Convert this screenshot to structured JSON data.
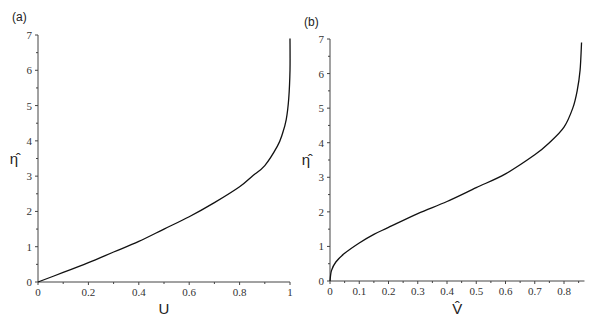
{
  "chart_data": [
    {
      "type": "line",
      "panel_label": "(a)",
      "xlabel": "U",
      "ylabel": "η̂",
      "xlim": [
        0,
        1
      ],
      "ylim": [
        0,
        7
      ],
      "xticks": [
        "0",
        "0.2",
        "0.4",
        "0.6",
        "0.8",
        "1"
      ],
      "yticks": [
        "0",
        "1",
        "2",
        "3",
        "4",
        "5",
        "6",
        "7"
      ],
      "grid": false,
      "series": [
        {
          "name": "U profile",
          "x": [
            0,
            0.1,
            0.2,
            0.3,
            0.4,
            0.5,
            0.6,
            0.7,
            0.8,
            0.85,
            0.9,
            0.95,
            0.97,
            0.985,
            0.995,
            1.0,
            1.0
          ],
          "y": [
            0,
            0.27,
            0.55,
            0.85,
            1.15,
            1.5,
            1.85,
            2.25,
            2.7,
            3.0,
            3.3,
            3.85,
            4.2,
            4.6,
            5.2,
            6.0,
            6.9
          ]
        }
      ]
    },
    {
      "type": "line",
      "panel_label": "(b)",
      "xlabel": "V̂",
      "ylabel": "η̂",
      "xlim": [
        0,
        0.87
      ],
      "ylim": [
        0,
        7
      ],
      "xticks": [
        "0",
        "0.1",
        "0.2",
        "0.3",
        "0.4",
        "0.5",
        "0.6",
        "0.7",
        "0.8"
      ],
      "yticks": [
        "0",
        "1",
        "2",
        "3",
        "4",
        "5",
        "6",
        "7"
      ],
      "grid": false,
      "series": [
        {
          "name": "V profile",
          "x": [
            0,
            0.005,
            0.02,
            0.05,
            0.1,
            0.15,
            0.2,
            0.3,
            0.4,
            0.5,
            0.6,
            0.7,
            0.75,
            0.8,
            0.83,
            0.845,
            0.855,
            0.86
          ],
          "y": [
            0,
            0.3,
            0.55,
            0.8,
            1.1,
            1.35,
            1.55,
            1.95,
            2.3,
            2.7,
            3.1,
            3.65,
            4.0,
            4.45,
            5.0,
            5.5,
            6.1,
            6.9
          ]
        }
      ]
    }
  ]
}
